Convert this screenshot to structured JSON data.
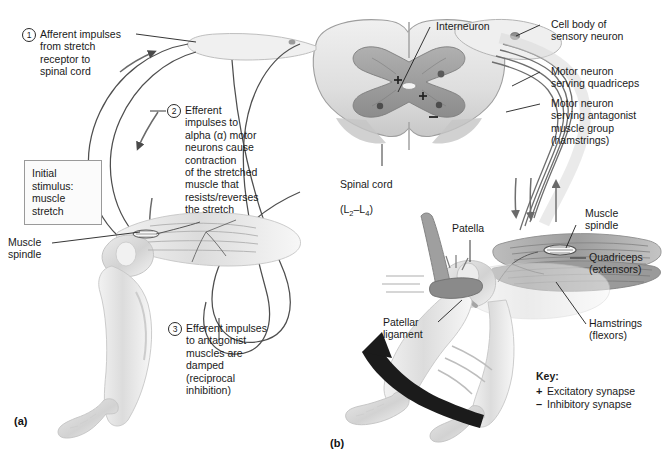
{
  "figure": {
    "panel_a_id": "(a)",
    "panel_b_id": "(b)"
  },
  "stimulus_box": {
    "text": "Initial\nstimulus:\nmuscle\nstretch"
  },
  "steps": [
    {
      "number": "1",
      "text": "Afferent impulses\nfrom stretch\nreceptor to\nspinal cord"
    },
    {
      "number": "2",
      "text": "Efferent\nimpulses to\nalpha (α) motor\nneurons cause\ncontraction\nof the stretched\nmuscle that\nresists/reverses\nthe stretch"
    },
    {
      "number": "3",
      "text": "Efferent impulses\nto antagonist\nmuscles are\ndamped\n(reciprocal\ninhibition)"
    }
  ],
  "labels": {
    "muscle_spindle_left": "Muscle\nspindle",
    "interneuron": "Interneuron",
    "cell_body_sensory_neuron": "Cell body of\nsensory neuron",
    "motor_neuron_quadriceps": "Motor neuron\nserving quadriceps",
    "motor_neuron_antagonist": "Motor neuron\nserving antagonist\nmuscle group\n(hamstrings)",
    "spinal_cord": "Spinal cord",
    "spinal_cord_segments": "(L2–L4)",
    "patella": "Patella",
    "patellar_ligament": "Patellar\nligament",
    "muscle_spindle_right": "Muscle\nspindle",
    "quadriceps": "Quadriceps\n(extensors)",
    "hamstrings": "Hamstrings\n(flexors)"
  },
  "key": {
    "title": "Key:",
    "entries": [
      {
        "symbol": "+",
        "label": "Excitatory synapse"
      },
      {
        "symbol": "–",
        "label": "Inhibitory synapse"
      }
    ]
  },
  "synapse_markers": [
    {
      "symbol": "+",
      "meaning": "excitatory"
    },
    {
      "symbol": "+",
      "meaning": "excitatory"
    },
    {
      "symbol": "–",
      "meaning": "inhibitory"
    }
  ],
  "colors": {
    "line": "#2a2a2a",
    "text": "#1a1a1a",
    "gray_matter": "#9a9a9a",
    "white_matter": "#d8d8d8",
    "skin": "#e2e2e2",
    "muscle": "#a8a8a8",
    "arrow_black": "#1b1b1b",
    "box_border": "#9a9a9a"
  }
}
